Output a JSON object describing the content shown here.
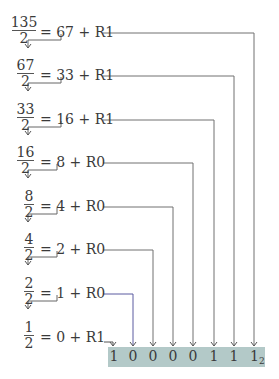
{
  "diagram": {
    "rows": [
      {
        "numerator": "135",
        "denominator": "2",
        "equation": "= 67 + R1",
        "bar_y": 31,
        "frac_left": 12,
        "frac_width": 24,
        "eq_left": 40,
        "line_end_x": 254,
        "bracket_x": 61,
        "line_color": "#707070"
      },
      {
        "numerator": "67",
        "denominator": "2",
        "equation": "= 33 + R1",
        "bar_y": 74,
        "frac_left": 17,
        "frac_width": 17,
        "eq_left": 40,
        "line_end_x": 234,
        "bracket_x": 61,
        "line_color": "#707070"
      },
      {
        "numerator": "33",
        "denominator": "2",
        "equation": "= 16 + R1",
        "bar_y": 118,
        "frac_left": 17,
        "frac_width": 17,
        "eq_left": 40,
        "line_end_x": 214,
        "bracket_x": 61,
        "line_color": "#707070"
      },
      {
        "numerator": "16",
        "denominator": "2",
        "equation": "= 8 + R0",
        "bar_y": 161,
        "frac_left": 17,
        "frac_width": 17,
        "eq_left": 40,
        "line_end_x": 193,
        "bracket_x": 57,
        "line_color": "#707070"
      },
      {
        "numerator": "8",
        "denominator": "2",
        "equation": "= 4 + R0",
        "bar_y": 205,
        "frac_left": 24,
        "frac_width": 10,
        "eq_left": 40,
        "line_end_x": 173,
        "bracket_x": 57,
        "line_color": "#707070"
      },
      {
        "numerator": "4",
        "denominator": "2",
        "equation": "= 2 + R0",
        "bar_y": 248,
        "frac_left": 24,
        "frac_width": 10,
        "eq_left": 40,
        "line_end_x": 153,
        "bracket_x": 57,
        "line_color": "#707070"
      },
      {
        "numerator": "2",
        "denominator": "2",
        "equation": "= 1 + R0",
        "bar_y": 292,
        "frac_left": 24,
        "frac_width": 10,
        "eq_left": 40,
        "line_end_x": 133,
        "bracket_x": 57,
        "line_color": "#5a5aa0"
      },
      {
        "numerator": "1",
        "denominator": "2",
        "equation": "= 0 + R1",
        "bar_y": 336,
        "frac_left": 24,
        "frac_width": 10,
        "eq_left": 40,
        "line_end_x": 114,
        "bracket_x": null,
        "line_color": "#707070"
      }
    ],
    "result": {
      "bits": [
        "1",
        "0",
        "0",
        "0",
        "0",
        "1",
        "1",
        "1"
      ],
      "bit_x": [
        114,
        133,
        153,
        173,
        193,
        214,
        234,
        254
      ],
      "base_subscript": "2",
      "box_color": "#b3c9c8"
    }
  }
}
